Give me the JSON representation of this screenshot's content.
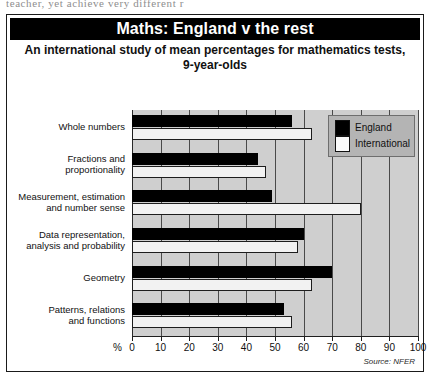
{
  "page": {
    "bleed_text": "teacher, yet achieve very different r"
  },
  "figure": {
    "title": "Maths: England v the rest",
    "subtitle": "An international study of mean percentages for mathematics tests, 9-year-olds",
    "source": "Source: NFER",
    "percent_symbol": "%"
  },
  "legend": {
    "position": "top-right",
    "entries": [
      {
        "label": "England",
        "color": "#000000"
      },
      {
        "label": "International",
        "color": "#fafafa"
      }
    ]
  },
  "chart_data": {
    "type": "bar",
    "orientation": "horizontal",
    "title": "Maths: England v the rest",
    "subtitle": "An international study of mean percentages for mathematics tests, 9-year-olds",
    "xlabel": "%",
    "ylabel": "",
    "xlim": [
      0,
      100
    ],
    "xticks": [
      0,
      10,
      20,
      30,
      40,
      50,
      60,
      70,
      80,
      90,
      100
    ],
    "grid": true,
    "legend": [
      "England",
      "International"
    ],
    "categories": [
      "Whole numbers",
      "Fractions and proportionality",
      "Measurement, estimation and number sense",
      "Data representation, analysis and probability",
      "Geometry",
      "Patterns, relations and functions"
    ],
    "category_lines": [
      [
        "Whole numbers"
      ],
      [
        "Fractions and",
        "proportionality"
      ],
      [
        "Measurement, estimation",
        "and number sense"
      ],
      [
        "Data representation,",
        "analysis and probability"
      ],
      [
        "Geometry"
      ],
      [
        "Patterns, relations",
        "and functions"
      ]
    ],
    "series": [
      {
        "name": "England",
        "color": "#000000",
        "values": [
          56,
          44,
          49,
          60,
          70,
          53
        ]
      },
      {
        "name": "International",
        "color": "#fafafa",
        "values": [
          63,
          47,
          80,
          58,
          63,
          56
        ]
      }
    ]
  }
}
